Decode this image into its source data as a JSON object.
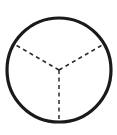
{
  "canvas": {
    "width": 117,
    "height": 135,
    "background_color": "#ffffff",
    "title": "Circle divided into three equal sectors by dashed radii"
  },
  "figure": {
    "type": "geometry-diagram",
    "shape": "circle",
    "description": "A circle outlined with a solid dark stroke, partitioned by three dashed radii meeting at the center, forming a Y shape that splits the disc into three equal 120-degree sectors.",
    "stroke_color": "#1a1a1a",
    "dash_color": "#2b2b2b",
    "fill_color": "#ffffff"
  },
  "circle": {
    "center_x": 59,
    "center_y": 70,
    "radius": 52,
    "stroke_width": 3.2,
    "stroke_color": "#1a1a1a",
    "fill": "none"
  },
  "center_point": {
    "label": "center",
    "x": 59,
    "y": 70
  },
  "radii": [
    {
      "name": "radius-down",
      "angle_degrees": 90,
      "end_x": 59,
      "end_y": 122,
      "style": "dashed",
      "dash_pattern": "4 3.5",
      "stroke_width": 1.5,
      "stroke_color": "#2b2b2b"
    },
    {
      "name": "radius-upper-left",
      "angle_degrees": 210,
      "end_x": 14,
      "end_y": 44,
      "style": "dashed",
      "dash_pattern": "4 3.5",
      "stroke_width": 1.5,
      "stroke_color": "#2b2b2b"
    },
    {
      "name": "radius-upper-right",
      "angle_degrees": 330,
      "end_x": 104,
      "end_y": 44,
      "style": "dashed",
      "dash_pattern": "4 3.5",
      "stroke_width": 1.5,
      "stroke_color": "#2b2b2b"
    }
  ],
  "sectors": [
    {
      "name": "sector-top",
      "span_degrees": 120
    },
    {
      "name": "sector-lower-left",
      "span_degrees": 120
    },
    {
      "name": "sector-lower-right",
      "span_degrees": 120
    }
  ],
  "labels": [],
  "annotations": []
}
